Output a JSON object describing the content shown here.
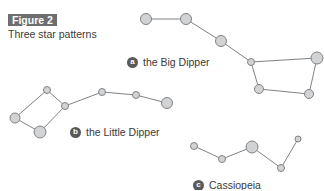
{
  "header": {
    "figure_label": "Figure 2",
    "subtitle": "Three star patterns"
  },
  "colors": {
    "badge_bg": "#6d6e70",
    "star_fill": "#d1d3d4",
    "star_stroke": "#808285",
    "line": "#808285",
    "letter_bg": "#58595b"
  },
  "patterns": [
    {
      "letter": "a",
      "name": "the Big Dipper",
      "label_pos": [
        127,
        56
      ],
      "stars": [
        [
          146,
          19,
          5.5
        ],
        [
          186,
          19,
          5.5
        ],
        [
          221,
          41,
          5.5
        ],
        [
          251,
          62,
          3.5
        ],
        [
          317,
          58,
          6
        ],
        [
          259,
          89,
          4.5
        ],
        [
          309,
          94,
          4.5
        ]
      ],
      "lines": [
        [
          0,
          1
        ],
        [
          1,
          2
        ],
        [
          2,
          3
        ],
        [
          3,
          4
        ],
        [
          3,
          5
        ],
        [
          5,
          6
        ],
        [
          6,
          4
        ]
      ]
    },
    {
      "letter": "b",
      "name": "the Little Dipper",
      "label_pos": [
        70,
        126
      ],
      "stars": [
        [
          47,
          90,
          3.5
        ],
        [
          65,
          106,
          3.5
        ],
        [
          15,
          118,
          5
        ],
        [
          40,
          132,
          6
        ],
        [
          102,
          92,
          3.5
        ],
        [
          136,
          95,
          3.5
        ],
        [
          167,
          103,
          5.5
        ]
      ],
      "lines": [
        [
          2,
          0
        ],
        [
          0,
          1
        ],
        [
          1,
          3
        ],
        [
          3,
          2
        ],
        [
          1,
          4
        ],
        [
          4,
          5
        ],
        [
          5,
          6
        ]
      ]
    },
    {
      "letter": "c",
      "name": "Cassiopeia",
      "label_pos": [
        193,
        179
      ],
      "stars": [
        [
          194,
          146,
          3.5
        ],
        [
          222,
          159,
          3.5
        ],
        [
          252,
          147,
          6
        ],
        [
          281,
          168,
          3.5
        ],
        [
          298,
          139,
          3
        ]
      ],
      "lines": [
        [
          0,
          1
        ],
        [
          1,
          2
        ],
        [
          2,
          3
        ],
        [
          3,
          4
        ]
      ]
    }
  ]
}
